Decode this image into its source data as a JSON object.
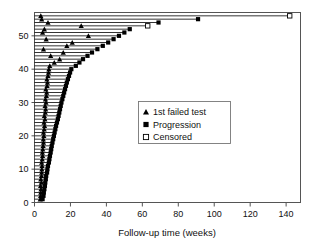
{
  "chart_data": {
    "type": "bar",
    "title": "",
    "subtitle": "",
    "xlabel": "Follow-up time (weeks)",
    "ylabel": "",
    "xlim": [
      0,
      148
    ],
    "ylim": [
      0,
      57
    ],
    "xticks": [
      0,
      20,
      40,
      60,
      80,
      100,
      120,
      140
    ],
    "yticks": [
      0,
      10,
      20,
      30,
      40,
      50
    ],
    "grid": false,
    "legend_position": "center-right",
    "legend": [
      {
        "label": "1st failed test",
        "marker": "filled-triangle",
        "color": "#000000"
      },
      {
        "label": "Progression",
        "marker": "filled-square",
        "color": "#000000"
      },
      {
        "label": "Censored",
        "marker": "open-square",
        "color": "#000000"
      }
    ],
    "series": [
      {
        "name": "Follow-up duration (horizontal bar per subject)",
        "description": "Each row is one subject; bar spans from 0 to end of follow-up.",
        "values": [
          4.5,
          5.0,
          5.2,
          5.5,
          5.8,
          6.0,
          6.3,
          6.5,
          7.0,
          7.2,
          7.5,
          8.0,
          8.3,
          8.6,
          9.0,
          9.3,
          9.6,
          10.0,
          10.4,
          10.8,
          11.2,
          11.6,
          12.0,
          12.5,
          13.0,
          13.4,
          13.8,
          14.2,
          14.6,
          15.0,
          15.5,
          16.0,
          16.5,
          17.0,
          17.5,
          18.0,
          18.6,
          19.2,
          19.8,
          20.5,
          23.0,
          25.0,
          27.0,
          29.5,
          32.0,
          35.0,
          38.0,
          41.0,
          44.0,
          47.0,
          50.0,
          53.0,
          63.0,
          69.0,
          91.0,
          142.0
        ]
      },
      {
        "name": "1st failed test",
        "marker": "filled-triangle",
        "description": "Time of first failed test for each subject (null = not observed).",
        "values": [
          3.2,
          3.4,
          3.5,
          3.6,
          3.4,
          3.8,
          3.5,
          3.9,
          4.0,
          4.1,
          4.2,
          4.0,
          4.3,
          4.5,
          4.4,
          4.6,
          4.8,
          5.0,
          4.9,
          5.2,
          5.0,
          5.4,
          5.6,
          5.3,
          5.8,
          5.5,
          6.0,
          6.2,
          5.9,
          6.4,
          6.1,
          6.6,
          6.8,
          6.3,
          7.0,
          7.2,
          6.9,
          7.5,
          7.8,
          8.0,
          8.5,
          11.0,
          14.0,
          9.0,
          16.0,
          5.0,
          18.0,
          21.0,
          6.5,
          30.0,
          4.5,
          5.5,
          26.0,
          7.5,
          4.0,
          3.5
        ]
      },
      {
        "name": "Endpoint",
        "description": "Marker type at end of each bar: progression (filled square) or censored (open square).",
        "values": [
          "Progression",
          "Progression",
          "Progression",
          "Progression",
          "Progression",
          "Progression",
          "Progression",
          "Progression",
          "Progression",
          "Progression",
          "Progression",
          "Progression",
          "Progression",
          "Progression",
          "Progression",
          "Progression",
          "Progression",
          "Progression",
          "Progression",
          "Progression",
          "Progression",
          "Progression",
          "Progression",
          "Progression",
          "Progression",
          "Progression",
          "Progression",
          "Progression",
          "Progression",
          "Progression",
          "Progression",
          "Progression",
          "Progression",
          "Progression",
          "Progression",
          "Progression",
          "Progression",
          "Progression",
          "Progression",
          "Progression",
          "Progression",
          "Progression",
          "Progression",
          "Progression",
          "Progression",
          "Progression",
          "Progression",
          "Progression",
          "Progression",
          "Progression",
          "Progression",
          "Progression",
          "Censored",
          "Progression",
          "Progression",
          "Censored"
        ]
      }
    ]
  },
  "axes": {
    "x_title": "Follow-up time (weeks)",
    "x_tick_labels": [
      "0",
      "20",
      "40",
      "60",
      "80",
      "100",
      "120",
      "140"
    ],
    "y_tick_labels": [
      "0",
      "10",
      "20",
      "30",
      "40",
      "50"
    ]
  },
  "legend": {
    "items": [
      {
        "label": "1st failed test",
        "marker": "filled-triangle"
      },
      {
        "label": "Progression",
        "marker": "filled-square"
      },
      {
        "label": "Censored",
        "marker": "open-square"
      }
    ]
  },
  "colors": {
    "ink": "#000000",
    "frame": "#555555",
    "background": "#ffffff"
  }
}
